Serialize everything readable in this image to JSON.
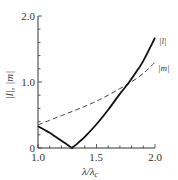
{
  "chart_data": {
    "type": "line",
    "title": "",
    "xlabel": "λ/λ_c",
    "ylabel": "|l|, |m|",
    "xlim": [
      1.0,
      2.0
    ],
    "ylim": [
      0,
      2.0
    ],
    "xticks": [
      "1.0",
      "1.5",
      "2.0"
    ],
    "yticks": [
      "0",
      "1.0",
      "2.0"
    ],
    "grid": false,
    "legend": "inline labels at right end of curves",
    "series": [
      {
        "name": "|l|",
        "style": "solid",
        "x": [
          1.0,
          1.05,
          1.1,
          1.15,
          1.2,
          1.25,
          1.29,
          1.35,
          1.4,
          1.5,
          1.6,
          1.7,
          1.78,
          1.85,
          1.9,
          2.0
        ],
        "values": [
          0.33,
          0.28,
          0.23,
          0.17,
          0.11,
          0.05,
          0.0,
          0.09,
          0.17,
          0.36,
          0.58,
          0.82,
          1.0,
          1.18,
          1.32,
          1.67
        ]
      },
      {
        "name": "|m|",
        "style": "dashed",
        "x": [
          1.0,
          1.1,
          1.2,
          1.3,
          1.4,
          1.5,
          1.6,
          1.7,
          1.78,
          1.9,
          2.0
        ],
        "values": [
          0.35,
          0.42,
          0.49,
          0.56,
          0.63,
          0.71,
          0.8,
          0.9,
          0.98,
          1.13,
          1.3
        ]
      }
    ]
  },
  "labels": {
    "y_tick_0": "0",
    "y_tick_1": "1.0",
    "y_tick_2": "2.0",
    "x_tick_0": "1.0",
    "x_tick_1": "1.5",
    "x_tick_2": "2.0",
    "ylabel": "|l|, |m|",
    "xlabel": "λ/λ",
    "xlabel_sub": "c",
    "series_l": "|l|",
    "series_m": "|m|"
  }
}
